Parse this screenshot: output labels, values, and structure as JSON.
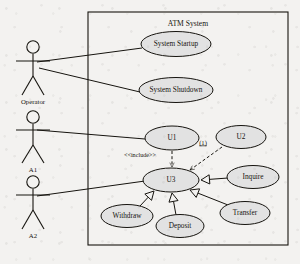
{
  "diagram": {
    "kind": "uml-use-case-diagram",
    "system_boundary": {
      "title": "ATM System",
      "x": 88,
      "y": 12,
      "width": 200,
      "height": 233
    },
    "colors": {
      "stroke": "#16140f",
      "usecase_fill": "#e2e2e2",
      "background": "#f3f2f0",
      "triangle_fill": "#f3f2f0"
    }
  },
  "actors": [
    {
      "id": "operator",
      "label": "Operator",
      "head_cx": 33,
      "head_cy": 47,
      "head_r": 6.2,
      "body_top": 54,
      "body_bottom": 76,
      "arm_y": 61,
      "arm_left": 16,
      "arm_right": 50,
      "leg_y": 95,
      "leg_dx": 11
    },
    {
      "id": "a1",
      "label": "A1",
      "head_cx": 33,
      "head_cy": 117,
      "head_r": 6.2,
      "body_top": 124,
      "body_bottom": 145,
      "arm_y": 130,
      "arm_left": 16,
      "arm_right": 50,
      "leg_y": 163,
      "leg_dx": 11
    },
    {
      "id": "a2",
      "label": "A2",
      "head_cx": 33,
      "head_cy": 182,
      "head_r": 6.2,
      "body_top": 189,
      "body_bottom": 210,
      "arm_y": 195,
      "arm_left": 16,
      "arm_right": 50,
      "leg_y": 229,
      "leg_dx": 11
    }
  ],
  "use_cases": [
    {
      "id": "system_startup",
      "label": "System Startup",
      "cx": 176,
      "cy": 44,
      "rx": 35,
      "ry": 12.5
    },
    {
      "id": "system_shutdown",
      "label": "System Shutdown",
      "cx": 176,
      "cy": 90,
      "rx": 37,
      "ry": 12.5
    },
    {
      "id": "u1",
      "label": "U1",
      "cx": 172,
      "cy": 138,
      "rx": 27,
      "ry": 12
    },
    {
      "id": "u2",
      "label": "U2",
      "cx": 241,
      "cy": 137,
      "rx": 25,
      "ry": 11.5
    },
    {
      "id": "u3",
      "label": "U3",
      "cx": 171,
      "cy": 180,
      "rx": 28,
      "ry": 12
    },
    {
      "id": "inquire",
      "label": "Inquire",
      "cx": 253,
      "cy": 177,
      "rx": 26,
      "ry": 11.5
    },
    {
      "id": "transfer",
      "label": "Transfer",
      "cx": 245,
      "cy": 213,
      "rx": 25,
      "ry": 11.5
    },
    {
      "id": "withdraw",
      "label": "Withdraw",
      "cx": 127,
      "cy": 216,
      "rx": 26,
      "ry": 11.5
    },
    {
      "id": "deposit",
      "label": "Deposit",
      "cx": 180,
      "cy": 226,
      "rx": 24,
      "ry": 11.5
    }
  ],
  "associations": [
    {
      "id": "operator-system-startup",
      "from": "operator",
      "to": "system_startup",
      "x1": 37,
      "y1": 62,
      "x2": 142,
      "y2": 48
    },
    {
      "id": "operator-system-shutdown",
      "from": "operator",
      "to": "system_shutdown",
      "x1": 39,
      "y1": 68,
      "x2": 140,
      "y2": 92
    },
    {
      "id": "a1-u1",
      "from": "a1",
      "to": "u1",
      "x1": 37,
      "y1": 130,
      "x2": 145,
      "y2": 139
    },
    {
      "id": "a2-u3",
      "from": "a2",
      "to": "u3",
      "x1": 37,
      "y1": 196,
      "x2": 145,
      "y2": 181
    }
  ],
  "include_relations": [
    {
      "id": "u1-include-u3",
      "from": "u1",
      "to": "u3",
      "stereotype": "<<include>>",
      "label_x": 140,
      "label_y": 156,
      "x1": 172,
      "y1": 151,
      "x2": 172,
      "y2": 167
    }
  ],
  "dependencies": [
    {
      "id": "u2-depends-u3",
      "from": "u2",
      "to": "u3",
      "label": "(1)",
      "label_x": 203,
      "label_y": 143,
      "x1": 222,
      "y1": 147,
      "x2": 190,
      "y2": 170
    }
  ],
  "generalizations": [
    {
      "id": "inquire-to-u3",
      "from": "inquire",
      "to": "u3",
      "x1": 228,
      "y1": 178,
      "x2": 201,
      "y2": 180
    },
    {
      "id": "transfer-to-u3",
      "from": "transfer",
      "to": "u3",
      "x1": 228,
      "y1": 205,
      "x2": 190,
      "y2": 190
    },
    {
      "id": "withdraw-to-u3",
      "from": "withdraw",
      "to": "u3",
      "x1": 140,
      "y1": 206,
      "x2": 154,
      "y2": 191
    },
    {
      "id": "deposit-to-u3",
      "from": "deposit",
      "to": "u3",
      "x1": 176,
      "y1": 215,
      "x2": 172,
      "y2": 193
    }
  ]
}
